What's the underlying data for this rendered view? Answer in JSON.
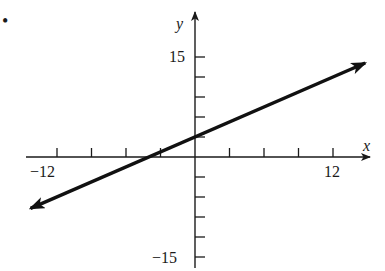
{
  "problem_marker": "•",
  "chart_data": {
    "type": "line",
    "title": "",
    "xlabel": "x",
    "ylabel": "y",
    "xlim": [
      -12,
      12
    ],
    "ylim": [
      -15,
      15
    ],
    "x_ticks": [
      -12,
      -9,
      -6,
      -3,
      3,
      6,
      9,
      12
    ],
    "y_ticks": [
      -15,
      -12,
      -9,
      -6,
      -3,
      3,
      6,
      9,
      12,
      15
    ],
    "x_tick_labels": {
      "-12": "−12",
      "12": "12"
    },
    "y_tick_labels": {
      "15": "15",
      "-15": "−15"
    },
    "grid": false,
    "legend": null,
    "series": [
      {
        "name": "line",
        "equation": "y = 0.75x + 3",
        "slope": 0.75,
        "intercept": 3,
        "x": [
          -14.3,
          14.8
        ],
        "y": [
          -7.7,
          14.1
        ],
        "arrows_both_ends": true,
        "color": "#111111"
      }
    ]
  },
  "labels": {
    "x_axis": "x",
    "y_axis": "y",
    "x_min": "−12",
    "x_max": "12",
    "y_max": "15",
    "y_min": "−15"
  }
}
